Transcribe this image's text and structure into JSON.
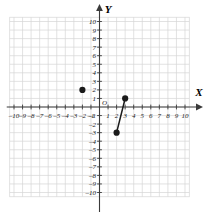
{
  "chart_data": {
    "type": "scatter",
    "title": "",
    "xlabel": "X",
    "ylabel": "Y",
    "xlim": [
      -10.5,
      10.5
    ],
    "ylim": [
      -10.5,
      10.5
    ],
    "grid": true,
    "grid_step": 1,
    "legend": "none",
    "origin_label": "O",
    "x_tick_labels": [
      "-10",
      "-9",
      "-8",
      "-7",
      "-6",
      "-5",
      "-4",
      "-3",
      "-2",
      "-1",
      "1",
      "2",
      "3",
      "4",
      "5",
      "6",
      "7",
      "8",
      "9",
      "10"
    ],
    "x_tick_values": [
      -10,
      -9,
      -8,
      -7,
      -6,
      -5,
      -4,
      -3,
      -2,
      -1,
      1,
      2,
      3,
      4,
      5,
      6,
      7,
      8,
      9,
      10
    ],
    "y_tick_labels": [
      "10",
      "9",
      "8",
      "7",
      "6",
      "5",
      "4",
      "3",
      "2",
      "1",
      "-1",
      "-2",
      "-3",
      "-4",
      "-5",
      "-6",
      "-7",
      "-8",
      "-9",
      "-10"
    ],
    "y_tick_values": [
      10,
      9,
      8,
      7,
      6,
      5,
      4,
      3,
      2,
      1,
      -1,
      -2,
      -3,
      -4,
      -5,
      -6,
      -7,
      -8,
      -9,
      -10
    ],
    "points": [
      {
        "name": "isolated-point",
        "x": -2,
        "y": 2
      },
      {
        "name": "segment-lower-endpoint",
        "x": 2,
        "y": -3
      },
      {
        "name": "segment-upper-endpoint",
        "x": 3,
        "y": 1
      }
    ],
    "segments": [
      {
        "name": "line-segment",
        "x1": 2,
        "y1": -3,
        "x2": 3,
        "y2": 1
      }
    ],
    "colors": {
      "grid": "#d6d6d6",
      "axis": "#3a3a3a",
      "point": "#1a1a1a",
      "segment": "#1a1a1a",
      "background": "#ffffff"
    }
  }
}
